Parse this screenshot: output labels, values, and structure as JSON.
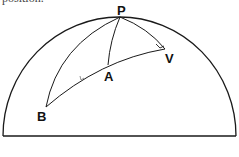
{
  "caption_fragment": "position.",
  "diagram": {
    "type": "celestial-sphere-hemisphere",
    "colors": {
      "stroke": "#1a1a1a",
      "background": "#ffffff"
    },
    "horizon_label": "",
    "points": [
      {
        "id": "P",
        "label": "P",
        "x": 120,
        "y": 17
      },
      {
        "id": "A",
        "label": "A",
        "x": 108,
        "y": 65
      },
      {
        "id": "V",
        "label": "V",
        "x": 165,
        "y": 50
      },
      {
        "id": "B",
        "label": "B",
        "x": 46,
        "y": 107
      }
    ],
    "arcs": [
      {
        "from": "P",
        "to": "B",
        "name": "arc-PB"
      },
      {
        "from": "P",
        "to": "A",
        "name": "arc-PA"
      },
      {
        "from": "P",
        "to": "V",
        "name": "arc-PV"
      },
      {
        "from": "B",
        "to": "V",
        "name": "arc-BAV",
        "through": "A"
      }
    ],
    "markers": [
      {
        "name": "right-angle-at-V",
        "at": "V"
      },
      {
        "name": "direction-tick-on-BA",
        "between": [
          "B",
          "A"
        ]
      }
    ]
  }
}
